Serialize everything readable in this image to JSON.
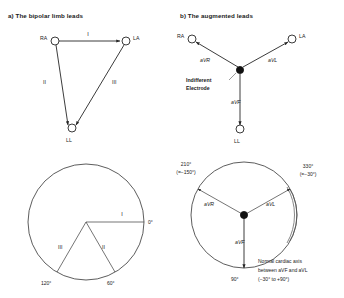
{
  "figure": {
    "panel_a": {
      "title": "a) The bipolar limb leads",
      "nodes": [
        {
          "id": "RA",
          "label": "RA"
        },
        {
          "id": "LA",
          "label": "LA"
        },
        {
          "id": "LL",
          "label": "LL"
        }
      ],
      "leads": [
        {
          "id": "I",
          "label": "I"
        },
        {
          "id": "II",
          "label": "II"
        },
        {
          "id": "III",
          "label": "III"
        }
      ]
    },
    "panel_b": {
      "title": "b) The augmented leads",
      "nodes": [
        {
          "id": "RA",
          "label": "RA"
        },
        {
          "id": "LA",
          "label": "LA"
        },
        {
          "id": "LL",
          "label": "LL"
        }
      ],
      "leads": [
        {
          "id": "aVR",
          "label": "aVR"
        },
        {
          "id": "aVL",
          "label": "aVL"
        },
        {
          "id": "aVF",
          "label": "aVF"
        }
      ],
      "center_label_line1": "Indifferent",
      "center_label_line2": "Electrode"
    },
    "circle_a": {
      "leads": [
        {
          "id": "I",
          "label": "I",
          "angle_label": "0°"
        },
        {
          "id": "II",
          "label": "II",
          "angle_label": "60°"
        },
        {
          "id": "III",
          "label": "III",
          "angle_label": "120°"
        }
      ]
    },
    "circle_b": {
      "leads": [
        {
          "id": "aVR",
          "label": "aVR",
          "angle_label": "210°",
          "angle_alt": "(=−150°)"
        },
        {
          "id": "aVL",
          "label": "aVL",
          "angle_label": "330°",
          "angle_alt": "(=−30°)"
        },
        {
          "id": "aVF",
          "label": "aVF",
          "angle_label": "90°",
          "angle_alt": ""
        }
      ],
      "caption_line1": "Normal cardiac axis",
      "caption_line2": "between aVF and aVL",
      "caption_line3": "(−30° to +90°)"
    },
    "colors": {
      "ink": "#1a1a1a",
      "line": "#262626",
      "electrode_fill": "#111111",
      "background": "#ffffff"
    }
  }
}
